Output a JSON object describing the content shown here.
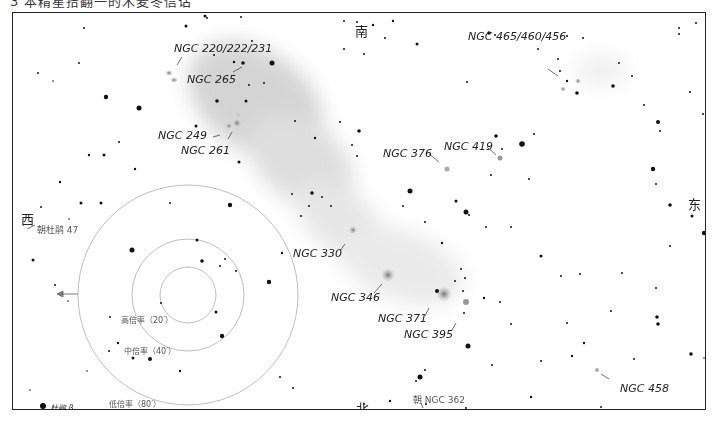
{
  "title": "3 本精星拾翻一的木麦冬信诂",
  "directions": {
    "north": "北",
    "south": "南",
    "east": "东",
    "west": "西"
  },
  "pointers": {
    "west_star": "朝杜鹃 47",
    "ngc362": "朝 NGC 362"
  },
  "eyepiece_fields": [
    {
      "label": "高倍率（20′）",
      "radius_px": 28
    },
    {
      "label": "中倍率（40′）",
      "radius_px": 56
    },
    {
      "label": "低倍率（80′）",
      "radius_px": 110
    }
  ],
  "legend": {
    "star_label": "杜鹃 β"
  },
  "objects": [
    {
      "name": "NGC 220/222/231"
    },
    {
      "name": "NGC 265"
    },
    {
      "name": "NGC 249"
    },
    {
      "name": "NGC 261"
    },
    {
      "name": "NGC 465/460/456"
    },
    {
      "name": "NGC 419"
    },
    {
      "name": "NGC 376"
    },
    {
      "name": "NGC 330"
    },
    {
      "name": "NGC 346"
    },
    {
      "name": "NGC 371"
    },
    {
      "name": "NGC 395"
    },
    {
      "name": "NGC 458"
    }
  ],
  "colors": {
    "frame": "#222222",
    "nebula": "#cfcfcf",
    "circle": "#bdbdbd"
  }
}
